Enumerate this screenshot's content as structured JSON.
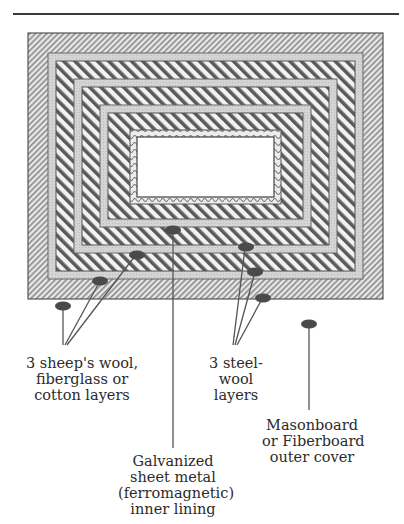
{
  "figure": {
    "type": "layered insulation box cross-section",
    "layers_outer_to_inner": [
      "Masonboard or Fiberboard outer cover",
      "sheep's wool / fiberglass / cotton layer 1",
      "steel-wool layer 1",
      "sheep's wool / fiberglass / cotton layer 2",
      "steel-wool layer 2",
      "sheep's wool / fiberglass / cotton layer 3",
      "steel-wool layer 3",
      "Galvanized sheet metal inner lining"
    ],
    "colors": {
      "line": "#555555",
      "outer_hatch": "#8a8a8a",
      "wool_fill": "#d6d6d6",
      "steel_hatch": "#5a5a5a",
      "marker": "#4a4a4a",
      "interior": "#ffffff"
    }
  },
  "labels": {
    "wool": [
      "3 sheep's wool,",
      "fiberglass or",
      "cotton layers"
    ],
    "steel": [
      "3 steel-",
      "wool",
      "layers"
    ],
    "lining": [
      "Galvanized",
      "sheet metal",
      "(ferromagnetic)",
      "inner lining"
    ],
    "cover": [
      "Masonboard",
      "or Fiberboard",
      "outer cover"
    ]
  }
}
